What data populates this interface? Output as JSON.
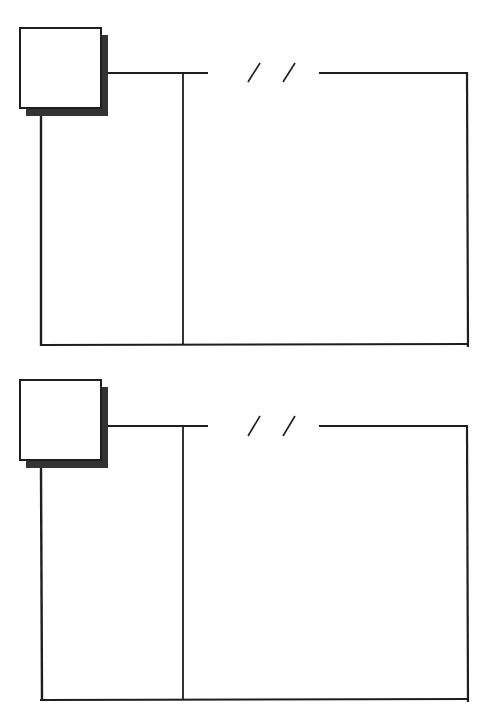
{
  "page": {
    "colors": {
      "ink": "#1e1e1e",
      "shadow": "#3a3a3a",
      "paper": "#ffffff"
    }
  },
  "panels": [
    {
      "id": "entry-1",
      "date_separator": "/ /",
      "photo_box": "",
      "left_column": "",
      "right_area": ""
    },
    {
      "id": "entry-2",
      "date_separator": "/ /",
      "photo_box": "",
      "left_column": "",
      "right_area": ""
    }
  ]
}
